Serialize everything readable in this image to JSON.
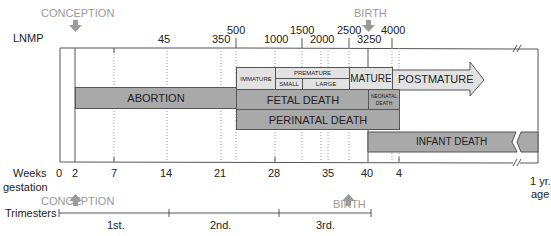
{
  "top_axis": {
    "label": "LNMP",
    "ticks": [
      {
        "value": "45",
        "x": 167
      },
      {
        "value": "350",
        "x": 222
      },
      {
        "value": "500",
        "x": 237
      },
      {
        "value": "1000",
        "x": 276
      },
      {
        "value": "1500",
        "x": 303
      },
      {
        "value": "2000",
        "x": 322
      },
      {
        "value": "2500",
        "x": 349
      },
      {
        "value": "3250",
        "x": 368
      },
      {
        "value": "4000",
        "x": 392
      }
    ]
  },
  "markers": {
    "conception_top": "CONCEPTION",
    "birth_top": "BIRTH",
    "conception_bottom": "CONCEPTION",
    "birth_bottom": "BIRTH"
  },
  "bars": {
    "immature": "IMMATURE",
    "premature": "PREMATURE",
    "small": "SMALL",
    "large": "LARGE",
    "mature": "MATURE",
    "postmature": "POSTMATURE",
    "abortion": "ABORTION",
    "fetal_death": "FETAL DEATH",
    "neonatal_death_line1": "NEONATAL",
    "neonatal_death_line2": "DEATH",
    "perinatal_death": "PERINATAL DEATH",
    "infant_death": "INFANT DEATH"
  },
  "bottom_axis": {
    "label_line1": "Weeks",
    "label_line2": "gestation",
    "ticks": [
      "0",
      "2",
      "7",
      "14",
      "21",
      "28",
      "35",
      "40",
      "4"
    ],
    "end_label_line1": "1 yr.",
    "end_label_line2": "age"
  },
  "trimesters": {
    "label": "Trimesters",
    "items": [
      "1st.",
      "2nd.",
      "3rd."
    ]
  },
  "colors": {
    "dark_bar": "#a9a9a9",
    "light_bar": "#e2e2e2",
    "marker_gray": "#9a9a9a"
  }
}
